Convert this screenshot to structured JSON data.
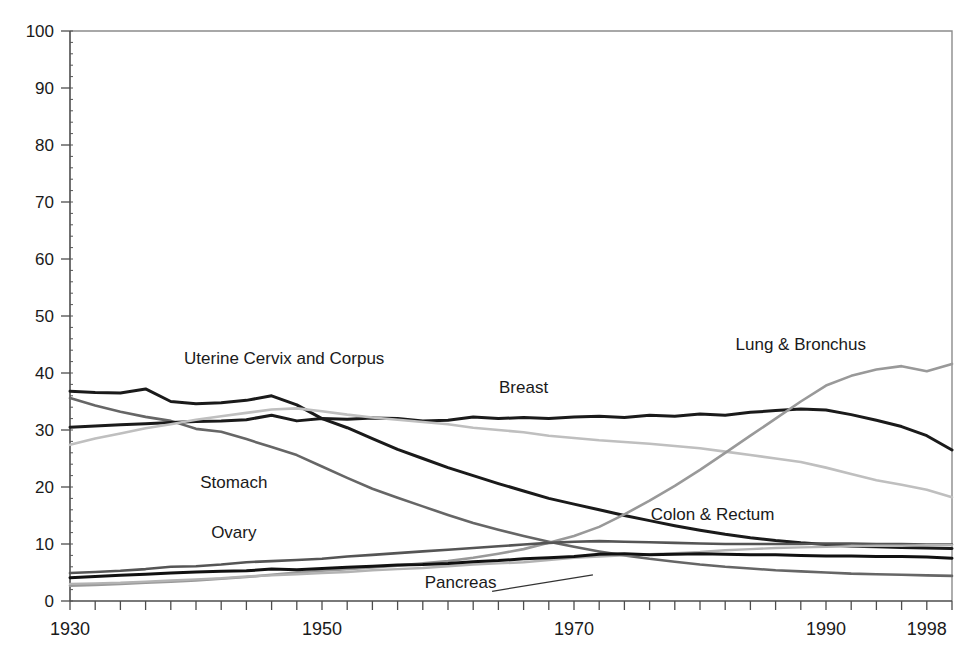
{
  "chart_data": {
    "type": "line",
    "title": "",
    "subtitle": "",
    "xlabel": "",
    "ylabel": "",
    "xlim": [
      1930,
      2000
    ],
    "ylim": [
      0,
      100
    ],
    "grid": false,
    "legend_position": "inline-annotations",
    "y_ticks": [
      0,
      10,
      20,
      30,
      40,
      50,
      60,
      70,
      80,
      90,
      100
    ],
    "y_tick_labels": [
      "0",
      "10",
      "20",
      "30",
      "40",
      "50",
      "60",
      "70",
      "80",
      "90",
      "100"
    ],
    "x_ticks": [
      1930,
      1950,
      1970,
      1990,
      1998
    ],
    "x_tick_labels": [
      "1930",
      "1950",
      "1970",
      "1990",
      "1998"
    ],
    "x_minor_tick_interval": 2,
    "x": [
      1930,
      1932,
      1934,
      1936,
      1938,
      1940,
      1942,
      1944,
      1946,
      1948,
      1950,
      1952,
      1954,
      1956,
      1958,
      1960,
      1962,
      1964,
      1966,
      1968,
      1970,
      1972,
      1974,
      1976,
      1978,
      1980,
      1982,
      1984,
      1986,
      1988,
      1990,
      1992,
      1994,
      1996,
      1998,
      2000
    ],
    "series": [
      {
        "name": "Uterine Cervix and Corpus",
        "color": "#1a1a1a",
        "width": 3.0,
        "label_x": 1947,
        "label_y": 41.5,
        "values": [
          36.8,
          36.6,
          36.5,
          37.2,
          35.0,
          34.6,
          34.8,
          35.2,
          36.0,
          34.4,
          32.0,
          30.4,
          28.5,
          26.6,
          25.0,
          23.4,
          22.0,
          20.6,
          19.3,
          18.0,
          17.0,
          16.0,
          15.0,
          14.1,
          13.2,
          12.4,
          11.7,
          11.1,
          10.6,
          10.2,
          9.9,
          9.6,
          9.5,
          9.4,
          9.3,
          9.2
        ]
      },
      {
        "name": "Stomach",
        "color": "#666666",
        "width": 2.6,
        "label_x": 1943,
        "label_y": 19.8,
        "values": [
          35.6,
          34.3,
          33.2,
          32.3,
          31.6,
          30.2,
          29.7,
          28.4,
          27.0,
          25.6,
          23.6,
          21.6,
          19.7,
          18.1,
          16.6,
          15.1,
          13.7,
          12.5,
          11.4,
          10.4,
          9.5,
          8.7,
          8.0,
          7.4,
          6.9,
          6.4,
          6.0,
          5.7,
          5.4,
          5.2,
          5.0,
          4.8,
          4.7,
          4.6,
          4.5,
          4.4
        ]
      },
      {
        "name": "Breast",
        "color": "#1a1a1a",
        "width": 3.0,
        "label_x": 1966,
        "label_y": 36.5,
        "values": [
          30.5,
          30.7,
          30.9,
          31.1,
          31.3,
          31.5,
          31.6,
          31.8,
          32.6,
          31.6,
          32.0,
          31.9,
          32.1,
          32.0,
          31.6,
          31.7,
          32.3,
          32.0,
          32.2,
          32.0,
          32.3,
          32.4,
          32.2,
          32.6,
          32.4,
          32.8,
          32.6,
          33.1,
          33.4,
          33.7,
          33.5,
          32.7,
          31.7,
          30.6,
          29.0,
          26.5
        ]
      },
      {
        "name": "Colon & Rectum",
        "color": "#bfbfbf",
        "width": 2.6,
        "label_x": 1981,
        "label_y": 14.2,
        "values": [
          27.4,
          28.5,
          29.4,
          30.3,
          31.0,
          31.8,
          32.4,
          33.0,
          33.6,
          33.8,
          33.3,
          32.7,
          32.2,
          31.8,
          31.4,
          31.0,
          30.4,
          30.0,
          29.6,
          29.0,
          28.6,
          28.2,
          27.9,
          27.6,
          27.2,
          26.8,
          26.2,
          25.6,
          25.0,
          24.4,
          23.4,
          22.3,
          21.2,
          20.4,
          19.5,
          18.2
        ]
      },
      {
        "name": "Lung & Bronchus",
        "color": "#999999",
        "width": 2.6,
        "label_x": 1988,
        "label_y": 44.0,
        "values": [
          2.7,
          2.8,
          3.0,
          3.2,
          3.4,
          3.6,
          3.9,
          4.2,
          4.6,
          5.0,
          5.3,
          5.6,
          5.9,
          6.2,
          6.6,
          7.0,
          7.6,
          8.3,
          9.1,
          10.2,
          11.4,
          13.0,
          15.2,
          17.6,
          20.2,
          23.0,
          26.0,
          29.0,
          32.0,
          35.0,
          37.8,
          39.5,
          40.6,
          41.2,
          40.3,
          41.6
        ]
      },
      {
        "name": "Ovary",
        "color": "#555555",
        "width": 2.6,
        "label_x": 1943,
        "label_y": 11.0,
        "values": [
          4.9,
          5.1,
          5.3,
          5.6,
          6.0,
          6.1,
          6.4,
          6.8,
          7.0,
          7.2,
          7.4,
          7.8,
          8.1,
          8.4,
          8.7,
          9.0,
          9.3,
          9.6,
          9.9,
          10.2,
          10.4,
          10.5,
          10.4,
          10.3,
          10.2,
          10.1,
          10.0,
          10.0,
          10.0,
          10.0,
          10.1,
          10.1,
          10.0,
          10.0,
          9.9,
          9.9
        ]
      },
      {
        "name": "Pancreas",
        "color": "#b3b3b3",
        "width": 2.4,
        "label_x": 1961,
        "label_y": 2.3,
        "values": [
          3.0,
          3.1,
          3.2,
          3.4,
          3.6,
          3.8,
          4.0,
          4.3,
          4.5,
          4.7,
          4.9,
          5.1,
          5.4,
          5.6,
          5.8,
          6.1,
          6.4,
          6.6,
          6.8,
          7.2,
          7.6,
          7.8,
          8.0,
          8.2,
          8.4,
          8.6,
          8.9,
          9.1,
          9.3,
          9.4,
          9.5,
          9.6,
          9.7,
          9.7,
          9.8,
          9.8
        ]
      },
      {
        "name": "Unlabeled lower black series",
        "color": "#111111",
        "width": 3.0,
        "label_x": null,
        "label_y": null,
        "values": [
          4.1,
          4.3,
          4.5,
          4.7,
          4.9,
          5.1,
          5.2,
          5.3,
          5.6,
          5.5,
          5.7,
          5.9,
          6.1,
          6.3,
          6.4,
          6.6,
          6.9,
          7.1,
          7.4,
          7.6,
          7.8,
          8.2,
          8.3,
          8.1,
          8.2,
          8.3,
          8.2,
          8.1,
          8.1,
          8.0,
          7.9,
          7.9,
          7.8,
          7.8,
          7.7,
          7.5
        ]
      }
    ],
    "annotations": [
      {
        "name": "pancreas-leader",
        "from_x": 1963.5,
        "from_y": 1.7,
        "to_x": 1971.5,
        "to_y": 4.6
      }
    ]
  }
}
